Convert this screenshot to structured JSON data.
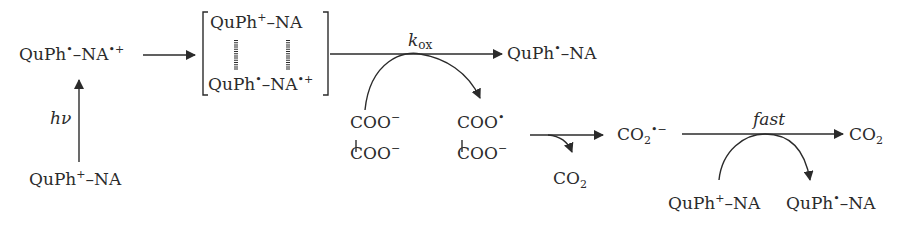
{
  "diagram": {
    "type": "reaction-scheme",
    "species": {
      "excited_radical": {
        "base": "QuPh",
        "sup1": "•",
        "mid": "–NA",
        "sup2": "•+"
      },
      "ground_start": {
        "base": "QuPh",
        "sup1": "+",
        "mid": "–NA"
      },
      "complex_top": {
        "base": "QuPh",
        "sup1": "+",
        "mid": "–NA"
      },
      "complex_bottom": {
        "base": "QuPh",
        "sup1": "•",
        "mid": "–NA",
        "sup2": "•+"
      },
      "product_radical": {
        "base": "QuPh",
        "sup1": "•",
        "mid": "–NA"
      },
      "oxalate_top": {
        "base": "COO",
        "sup": "−"
      },
      "oxalate_bottom": {
        "base": "COO",
        "sup": "−"
      },
      "oxalate_radical_top": {
        "base": "COO",
        "sup": "•"
      },
      "oxalate_radical_bottom": {
        "base": "COO",
        "sup": "−"
      },
      "co2_released": {
        "base": "CO",
        "sub": "2"
      },
      "co2_radical_anion": {
        "base": "CO",
        "sub": "2",
        "sup": "•−"
      },
      "co2_final": {
        "base": "CO",
        "sub": "2"
      },
      "reductant_reactant": {
        "base": "QuPh",
        "sup1": "+",
        "mid": "–NA"
      },
      "reductant_product": {
        "base": "QuPh",
        "sup1": "•",
        "mid": "–NA"
      }
    },
    "labels": {
      "photoexcitation": "hν",
      "rate_constant_k": "k",
      "rate_constant_sub": "ox",
      "fast_step": "fast"
    },
    "colors": {
      "ink": "#2b2b2b",
      "background": "#ffffff"
    }
  }
}
